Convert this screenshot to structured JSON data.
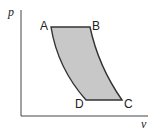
{
  "diagram": {
    "type": "pv-cycle",
    "axes": {
      "y_label": "p",
      "x_label": "v"
    },
    "points": {
      "A": {
        "label": "A"
      },
      "B": {
        "label": "B"
      },
      "C": {
        "label": "C"
      },
      "D": {
        "label": "D"
      }
    },
    "region_fill": "#c8c8c8",
    "line_color": "#333333"
  }
}
